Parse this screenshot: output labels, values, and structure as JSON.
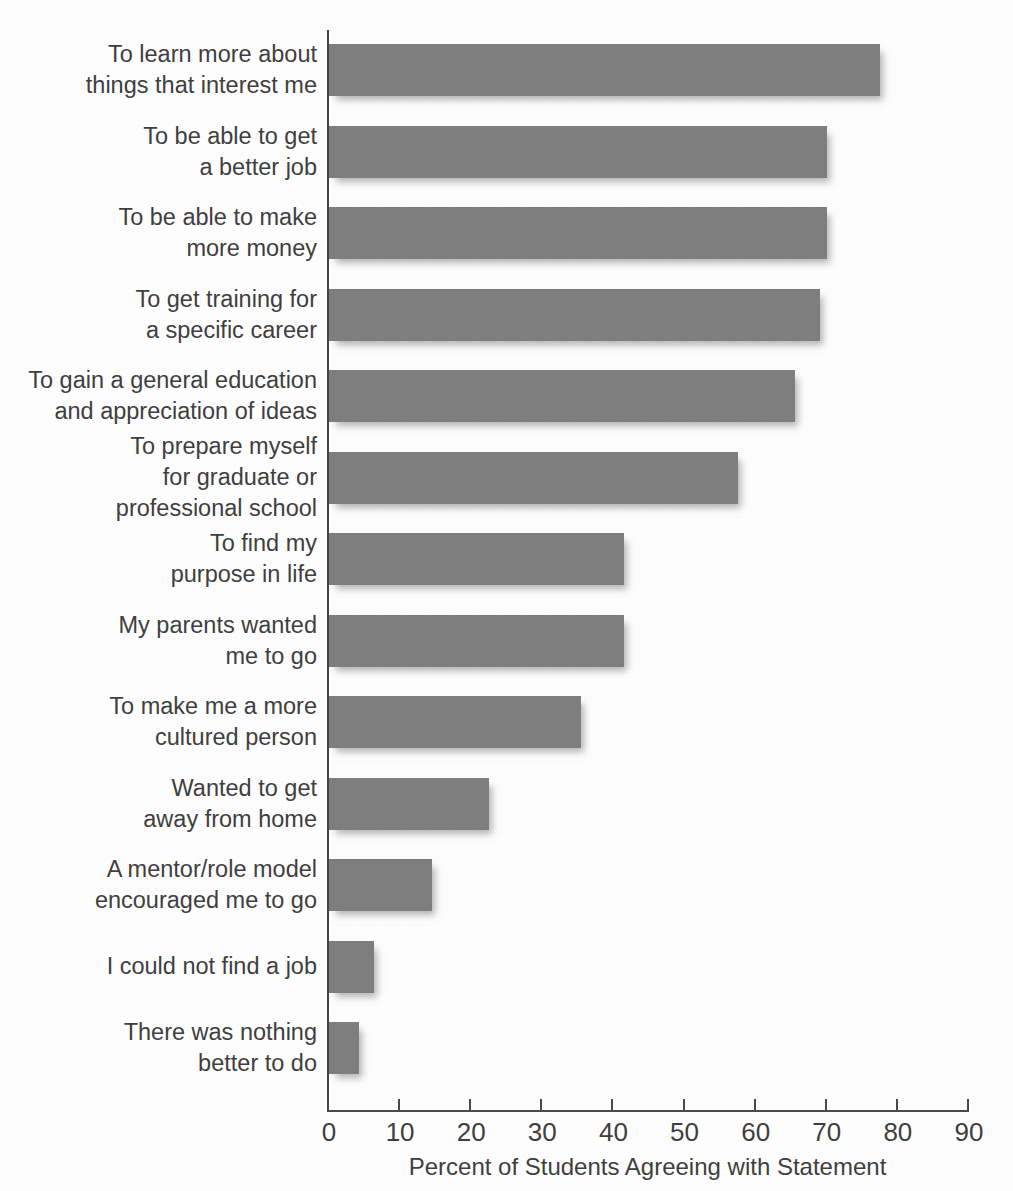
{
  "chart_data": {
    "type": "bar",
    "orientation": "horizontal",
    "title": "",
    "title_note": "title row is cropped off the top edge of the screenshot; only letter descenders are visible",
    "xlabel": "Percent of Students Agreeing with Statement",
    "ylabel": "",
    "xlim": [
      0,
      90
    ],
    "xticks": [
      0,
      10,
      20,
      30,
      40,
      50,
      60,
      70,
      80,
      90
    ],
    "xtick_labels": [
      "0",
      "10",
      "20",
      "30",
      "40",
      "50",
      "60",
      "70",
      "80",
      "90"
    ],
    "grid": false,
    "legend": null,
    "bar_color": "#7f7f80",
    "text_color": "#3f3f3f",
    "axis_color": "#4a4a4a",
    "categories": [
      "To learn more about\nthings that interest me",
      "To be able to get\na better job",
      "To be able to make\nmore money",
      "To get training for\na specific career",
      "To gain a general education\nand appreciation of ideas",
      "To prepare myself\nfor graduate or\nprofessional school",
      "To find my\npurpose in life",
      "My parents wanted\nme to go",
      "To make me a more\ncultured person",
      "Wanted to get\naway from home",
      "A mentor/role model\nencouraged me to go",
      "I could not find a job",
      "There was nothing\nbetter to do"
    ],
    "values": [
      77.5,
      70,
      70,
      69,
      65.5,
      57.5,
      41.5,
      41.5,
      35.5,
      22.5,
      14.5,
      6.3,
      4.2
    ]
  }
}
